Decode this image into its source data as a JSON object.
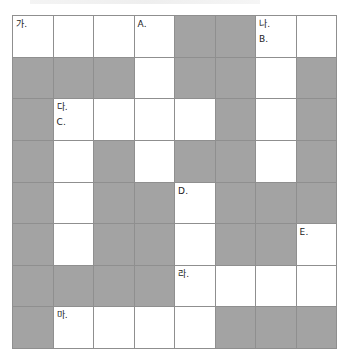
{
  "puzzle": {
    "rows": 8,
    "cols": 8,
    "colors": {
      "open_cell": "#ffffff",
      "blocked_cell": "#a3a3a3",
      "grid_line": "#8f8f8f"
    },
    "cells": [
      [
        {
          "open": true,
          "labels": [
            "가."
          ]
        },
        {
          "open": true,
          "labels": []
        },
        {
          "open": true,
          "labels": []
        },
        {
          "open": true,
          "labels": [
            "A."
          ]
        },
        {
          "open": false,
          "labels": []
        },
        {
          "open": false,
          "labels": []
        },
        {
          "open": true,
          "labels": [
            "나.",
            "B."
          ]
        },
        {
          "open": true,
          "labels": []
        }
      ],
      [
        {
          "open": false,
          "labels": []
        },
        {
          "open": false,
          "labels": []
        },
        {
          "open": false,
          "labels": []
        },
        {
          "open": true,
          "labels": []
        },
        {
          "open": false,
          "labels": []
        },
        {
          "open": false,
          "labels": []
        },
        {
          "open": true,
          "labels": []
        },
        {
          "open": false,
          "labels": []
        }
      ],
      [
        {
          "open": false,
          "labels": []
        },
        {
          "open": true,
          "labels": [
            "다.",
            "C."
          ]
        },
        {
          "open": true,
          "labels": []
        },
        {
          "open": true,
          "labels": []
        },
        {
          "open": true,
          "labels": []
        },
        {
          "open": false,
          "labels": []
        },
        {
          "open": true,
          "labels": []
        },
        {
          "open": false,
          "labels": []
        }
      ],
      [
        {
          "open": false,
          "labels": []
        },
        {
          "open": true,
          "labels": []
        },
        {
          "open": false,
          "labels": []
        },
        {
          "open": true,
          "labels": []
        },
        {
          "open": false,
          "labels": []
        },
        {
          "open": false,
          "labels": []
        },
        {
          "open": true,
          "labels": []
        },
        {
          "open": false,
          "labels": []
        }
      ],
      [
        {
          "open": false,
          "labels": []
        },
        {
          "open": true,
          "labels": []
        },
        {
          "open": false,
          "labels": []
        },
        {
          "open": false,
          "labels": []
        },
        {
          "open": true,
          "labels": [
            "D."
          ]
        },
        {
          "open": false,
          "labels": []
        },
        {
          "open": false,
          "labels": []
        },
        {
          "open": false,
          "labels": []
        }
      ],
      [
        {
          "open": false,
          "labels": []
        },
        {
          "open": true,
          "labels": []
        },
        {
          "open": false,
          "labels": []
        },
        {
          "open": false,
          "labels": []
        },
        {
          "open": true,
          "labels": []
        },
        {
          "open": false,
          "labels": []
        },
        {
          "open": false,
          "labels": []
        },
        {
          "open": true,
          "labels": [
            "E."
          ]
        }
      ],
      [
        {
          "open": false,
          "labels": []
        },
        {
          "open": false,
          "labels": []
        },
        {
          "open": false,
          "labels": []
        },
        {
          "open": false,
          "labels": []
        },
        {
          "open": true,
          "labels": [
            "라."
          ]
        },
        {
          "open": true,
          "labels": []
        },
        {
          "open": true,
          "labels": []
        },
        {
          "open": true,
          "labels": []
        }
      ],
      [
        {
          "open": false,
          "labels": []
        },
        {
          "open": true,
          "labels": [
            "마."
          ]
        },
        {
          "open": true,
          "labels": []
        },
        {
          "open": true,
          "labels": []
        },
        {
          "open": true,
          "labels": []
        },
        {
          "open": false,
          "labels": []
        },
        {
          "open": false,
          "labels": []
        },
        {
          "open": false,
          "labels": []
        }
      ]
    ]
  }
}
